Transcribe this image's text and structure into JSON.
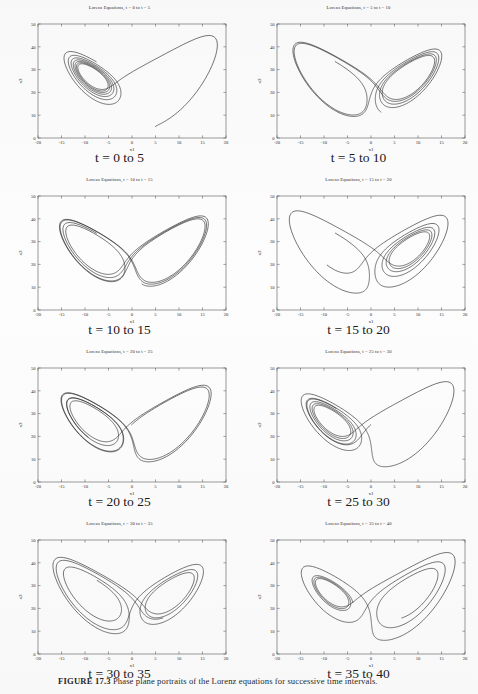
{
  "figure": {
    "caption_label": "FIGURE 17.3",
    "caption_text": "Phase plane portraits of the Lorenz equations for successive time intervals."
  },
  "axes": {
    "xlabel": "x1",
    "ylabel": "x3",
    "xticks": [
      "-20",
      "-15",
      "-10",
      "-5",
      "0",
      "5",
      "10",
      "15",
      "20"
    ],
    "yticks": [
      "0",
      "10",
      "20",
      "30",
      "40",
      "50"
    ],
    "xlim": [
      -20,
      20
    ],
    "ylim": [
      0,
      50
    ],
    "line_color": "#1a1a1a",
    "frame_color": "#555555"
  },
  "panels": [
    {
      "title": "Lorenz Equations, t = 0 to t = 5",
      "caption": "t = 0 to 5",
      "t_start": 0,
      "t_end": 5
    },
    {
      "title": "Lorenz Equations, t = 5 to t = 10",
      "caption": "t = 5 to 10",
      "t_start": 5,
      "t_end": 10
    },
    {
      "title": "Lorenz Equations, t = 10 to t = 15",
      "caption": "t = 10 to 15",
      "t_start": 10,
      "t_end": 15
    },
    {
      "title": "Lorenz Equations, t = 15 to t = 20",
      "caption": "t = 15 to 20",
      "t_start": 15,
      "t_end": 20
    },
    {
      "title": "Lorenz Equations, t = 20 to t = 25",
      "caption": "t = 20 to 25",
      "t_start": 20,
      "t_end": 25
    },
    {
      "title": "Lorenz Equations, t = 25 to t = 30",
      "caption": "t = 25 to 30",
      "t_start": 25,
      "t_end": 30
    },
    {
      "title": "Lorenz Equations, t = 30 to t = 35",
      "caption": "t = 30 to 35",
      "t_start": 30,
      "t_end": 35
    },
    {
      "title": "Lorenz Equations, t = 35 to t = 40",
      "caption": "t = 35 to 40",
      "t_start": 35,
      "t_end": 40
    }
  ],
  "chart_data": {
    "type": "line",
    "xlabel": "x1",
    "ylabel": "x3",
    "xlim": [
      -20,
      20
    ],
    "ylim": [
      0,
      50
    ],
    "grid": false,
    "legend": "none",
    "system": {
      "name": "Lorenz equations",
      "sigma": 10,
      "rho": 28,
      "beta": 2.6666666667,
      "initial_condition": [
        5,
        5,
        5
      ],
      "dt": 0.004
    },
    "series": [
      {
        "name": "t = 0 to 5",
        "t_start": 0,
        "t_end": 5
      },
      {
        "name": "t = 5 to 10",
        "t_start": 5,
        "t_end": 10
      },
      {
        "name": "t = 10 to 15",
        "t_start": 10,
        "t_end": 15
      },
      {
        "name": "t = 15 to 20",
        "t_start": 15,
        "t_end": 20
      },
      {
        "name": "t = 20 to 25",
        "t_start": 20,
        "t_end": 25
      },
      {
        "name": "t = 25 to 30",
        "t_start": 25,
        "t_end": 30
      },
      {
        "name": "t = 30 to 35",
        "t_start": 30,
        "t_end": 35
      },
      {
        "name": "t = 35 to 40",
        "t_start": 35,
        "t_end": 40
      }
    ]
  }
}
